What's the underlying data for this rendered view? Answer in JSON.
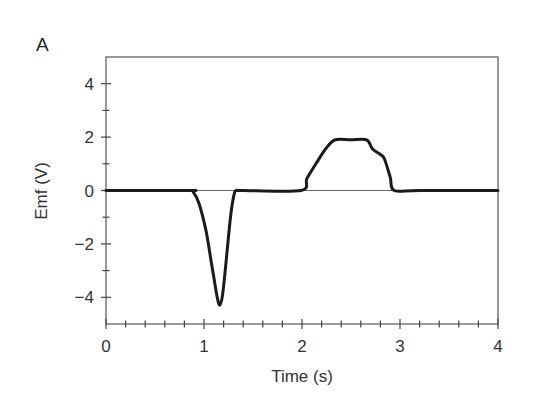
{
  "panel_label": "A",
  "chart_data": {
    "type": "line",
    "title": "",
    "xlabel": "Time (s)",
    "ylabel": "Emf (V)",
    "xlim": [
      0,
      4
    ],
    "ylim": [
      -5,
      5
    ],
    "x_ticks": [
      0,
      1,
      2,
      3,
      4
    ],
    "y_ticks": [
      -4,
      -2,
      0,
      2,
      4
    ],
    "x_tick_labels": [
      "0",
      "1",
      "2",
      "3",
      "4"
    ],
    "y_tick_labels": [
      "−4",
      "−2",
      "0",
      "2",
      "4"
    ],
    "x_minor_step": 0.2,
    "y_minor_step": 1,
    "grid": false,
    "legend": null,
    "zero_line": true,
    "series": [
      {
        "name": "Emf",
        "color": "#1a1a1a",
        "x": [
          0.0,
          0.85,
          0.89,
          0.95,
          1.02,
          1.08,
          1.13,
          1.16,
          1.19,
          1.23,
          1.27,
          1.31,
          1.34,
          1.4,
          1.99,
          2.05,
          2.15,
          2.25,
          2.34,
          2.5,
          2.66,
          2.72,
          2.8,
          2.84,
          2.9,
          2.94,
          3.2,
          4.0
        ],
        "y": [
          0.0,
          0.0,
          -0.05,
          -0.5,
          -1.5,
          -2.8,
          -3.9,
          -4.3,
          -3.9,
          -2.5,
          -1.0,
          -0.1,
          0.0,
          0.0,
          0.0,
          0.45,
          1.05,
          1.6,
          1.9,
          1.9,
          1.9,
          1.55,
          1.35,
          1.2,
          0.5,
          0.0,
          0.0,
          0.0
        ]
      }
    ]
  }
}
